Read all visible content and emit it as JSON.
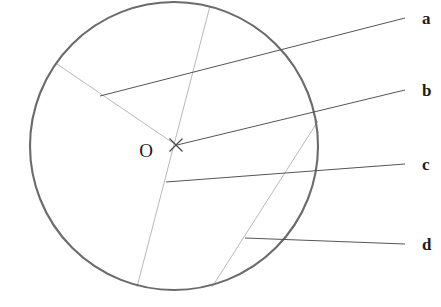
{
  "figure": {
    "background_color": "#ffffff",
    "width": 441,
    "height": 307
  },
  "colors": {
    "circle_stroke": "#6b6b6b",
    "construction_line": "#b9b9b9",
    "leader_line": "#555555",
    "center_mark": "#4a4a4a",
    "label_text": "#1c1c1c",
    "center_label_text": "#1a1a1a"
  },
  "circle": {
    "name": "main-circle",
    "center_x": 174,
    "center_y": 146,
    "radius": 144,
    "stroke_width": 2.1
  },
  "center": {
    "label": "O",
    "label_x": 146,
    "label_y": 157,
    "mark_x": 176,
    "mark_y": 145,
    "mark_size": 13
  },
  "construction_lines": [
    {
      "name": "radius-upper-left",
      "x1": 57,
      "y1": 64,
      "x2": 176,
      "y2": 145
    },
    {
      "name": "diameter-top-to-bottom-left",
      "x1": 210,
      "y1": 6,
      "x2": 137,
      "y2": 287
    },
    {
      "name": "chord-right-to-bottom",
      "x1": 318,
      "y1": 121,
      "x2": 212,
      "y2": 287
    }
  ],
  "leaders": [
    {
      "name": "leader-a",
      "label": "a",
      "x1": 100,
      "y1": 96,
      "x2": 405,
      "y2": 18,
      "label_x": 422,
      "label_y": 24
    },
    {
      "name": "leader-b",
      "label": "b",
      "x1": 177,
      "y1": 145,
      "x2": 405,
      "y2": 90,
      "label_x": 422,
      "label_y": 96
    },
    {
      "name": "leader-c",
      "label": "c",
      "x1": 166,
      "y1": 182,
      "x2": 405,
      "y2": 164,
      "label_x": 422,
      "label_y": 170
    },
    {
      "name": "leader-d",
      "label": "d",
      "x1": 245,
      "y1": 238,
      "x2": 405,
      "y2": 244,
      "label_x": 422,
      "label_y": 250
    }
  ]
}
